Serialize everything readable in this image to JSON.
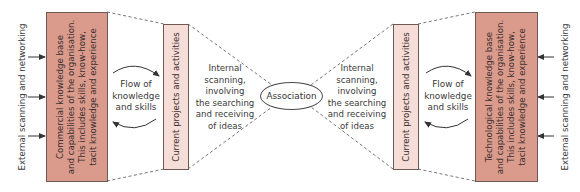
{
  "diagram": {
    "left": {
      "external_label": "External scanning and networking",
      "knowledge_box": "Commercial knowledge base\nand capabilities of the organisation.\nThis includes skills, know-how,\ntacit knowledge and experience",
      "projects_box": "Current projects and activities",
      "flow_label": "Flow of\nknowledge\nand skills",
      "internal_label": "Internal\nscanning,\ninvolving\nthe searching\nand receiving\nof ideas"
    },
    "center": {
      "node_label": "Association"
    },
    "right": {
      "external_label": "External scanning and networking",
      "knowledge_box": "Technological knowledge base\nand capabilities of the organisation.\nThis includes skills, know-how,\ntacit knowledge and experience",
      "projects_box": "Current projects and activities",
      "flow_label": "Flow of\nknowledge\nand skills",
      "internal_label": "Internal\nscanning,\ninvolving\nthe searching\nand receiving\nof ideas"
    },
    "colors": {
      "knowledge_box_fill": "#db9b8c",
      "projects_box_fill": "#f6ddd7",
      "border": "#6e5a55",
      "line": "#555555"
    }
  }
}
